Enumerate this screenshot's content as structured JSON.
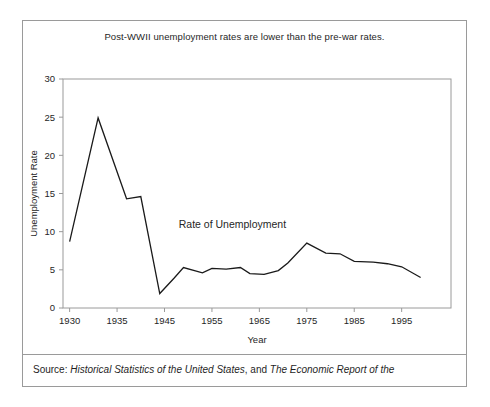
{
  "figure": {
    "title": "Post-WWII unemployment rates are lower than the pre-war rates.",
    "annotation": "Rate of Unemployment",
    "source_prefix": "Source: ",
    "source_italic_1": "Historical Statistics of the United States",
    "source_mid": ", and ",
    "source_italic_2": "The Economic Report of the",
    "frame_color": "#9a9a9a",
    "line_color": "#1a1a1a"
  },
  "chart_data": {
    "type": "line",
    "title": "Post-WWII unemployment rates are lower than the pre-war rates.",
    "xlabel": "Year",
    "ylabel": "Unemployment Rate",
    "xlim": [
      1930,
      1999
    ],
    "ylim": [
      0,
      30
    ],
    "grid": false,
    "legend": false,
    "annotations": [
      {
        "text": "Rate of Unemployment",
        "x": 1948,
        "y": 10.5
      }
    ],
    "xticks": [
      1930,
      1935,
      1945,
      1955,
      1965,
      1975,
      1985,
      1995
    ],
    "xticklabels": [
      "1930",
      "1935",
      "1945",
      "1955",
      "1965",
      "1975",
      "1985",
      "1995"
    ],
    "yticks": [
      0,
      5,
      10,
      15,
      20,
      25,
      30
    ],
    "yticklabels": [
      "0",
      "5",
      "10",
      "15",
      "20",
      "25",
      "30"
    ],
    "series": [
      {
        "name": "Rate of Unemployment",
        "x": [
          1930,
          1933,
          1937,
          1940,
          1944,
          1947,
          1949,
          1953,
          1955,
          1958,
          1961,
          1963,
          1966,
          1969,
          1971,
          1975,
          1979,
          1982,
          1985,
          1989,
          1992,
          1995,
          1999
        ],
        "values": [
          8.7,
          24.9,
          14.3,
          14.6,
          1.9,
          3.9,
          5.3,
          4.6,
          5.2,
          5.1,
          5.3,
          4.5,
          4.4,
          4.9,
          5.9,
          8.5,
          7.2,
          7.1,
          6.1,
          6.0,
          5.8,
          5.4,
          4.0
        ]
      }
    ]
  }
}
